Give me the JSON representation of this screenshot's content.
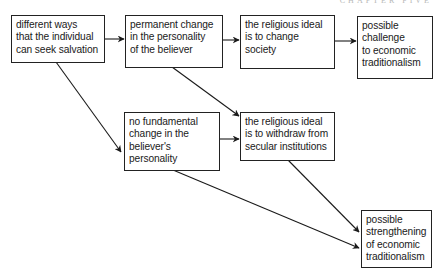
{
  "running_head": "Chapter Five",
  "diagram": {
    "nodes": [
      {
        "id": "salvation_ways",
        "text": "different ways\nthat the individual\ncan seek salvation"
      },
      {
        "id": "permanent_change",
        "text": "permanent change\nin the personality\nof the believer"
      },
      {
        "id": "change_society",
        "text": "the religious ideal\nis to change\nsociety"
      },
      {
        "id": "challenge_tradition",
        "text": "possible\nchallenge\nto economic\ntraditionalism"
      },
      {
        "id": "no_fundamental_change",
        "text": "no fundamental\nchange in the\nbeliever's\npersonality"
      },
      {
        "id": "withdraw",
        "text": "the religious ideal\nis to withdraw from\nsecular institutions"
      },
      {
        "id": "strengthening_tradition",
        "text": "possible\nstrengthening\nof economic\ntraditionalism"
      }
    ],
    "edges": [
      {
        "from": "salvation_ways",
        "to": "permanent_change"
      },
      {
        "from": "permanent_change",
        "to": "change_society"
      },
      {
        "from": "change_society",
        "to": "challenge_tradition"
      },
      {
        "from": "salvation_ways",
        "to": "no_fundamental_change"
      },
      {
        "from": "permanent_change",
        "to": "withdraw"
      },
      {
        "from": "no_fundamental_change",
        "to": "withdraw"
      },
      {
        "from": "withdraw",
        "to": "strengthening_tradition"
      },
      {
        "from": "no_fundamental_change",
        "to": "strengthening_tradition"
      }
    ]
  }
}
